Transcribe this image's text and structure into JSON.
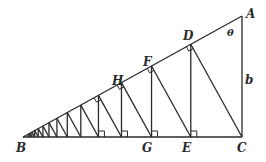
{
  "diagram": {
    "type": "geometry-right-triangle-iterated-perpendiculars",
    "labels": {
      "A": "A",
      "B": "B",
      "C": "C",
      "D": "D",
      "E": "E",
      "F": "F",
      "G": "G",
      "H": "H",
      "theta": "θ",
      "b": "b"
    },
    "vertices": {
      "A": [
        242,
        16
      ],
      "B": [
        23,
        137
      ],
      "C": [
        242,
        137
      ]
    },
    "iterations": 14,
    "stroke_color": "#2a2a2a"
  }
}
